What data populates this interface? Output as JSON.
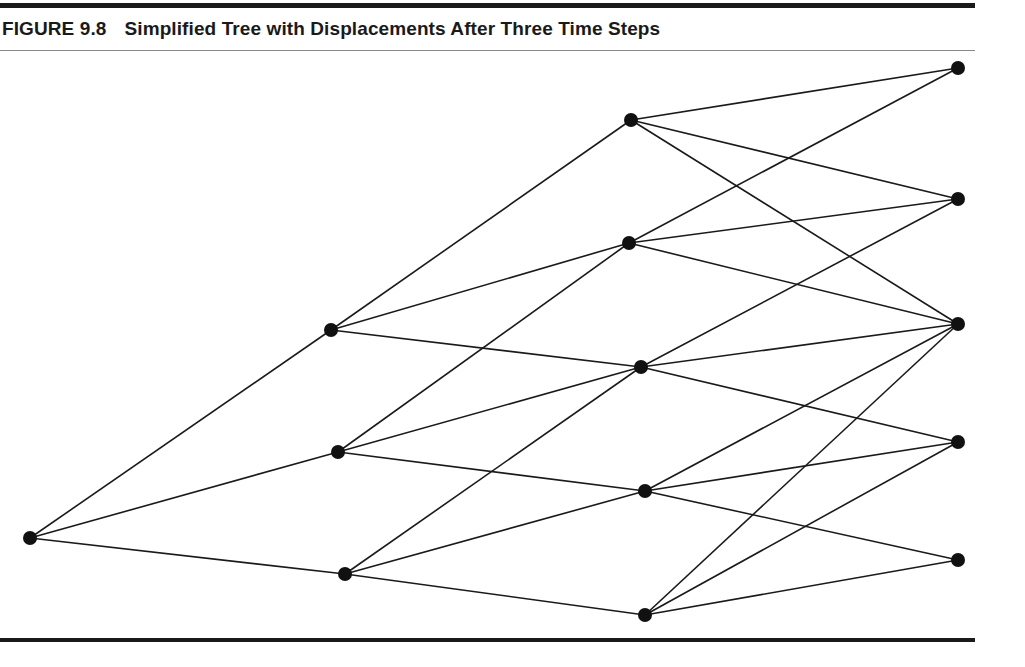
{
  "figure": {
    "label": "FIGURE 9.8",
    "title": "Simplified Tree with Displacements After Three Time Steps"
  },
  "tree": {
    "nodes": [
      {
        "id": "r",
        "step": 0,
        "x": 30,
        "y": 538
      },
      {
        "id": "a1",
        "step": 1,
        "x": 331,
        "y": 330
      },
      {
        "id": "a2",
        "step": 1,
        "x": 338,
        "y": 452
      },
      {
        "id": "a3",
        "step": 1,
        "x": 345,
        "y": 574
      },
      {
        "id": "b1",
        "step": 2,
        "x": 631,
        "y": 120
      },
      {
        "id": "b2",
        "step": 2,
        "x": 629,
        "y": 243
      },
      {
        "id": "b3",
        "step": 2,
        "x": 641,
        "y": 367
      },
      {
        "id": "b4",
        "step": 2,
        "x": 645,
        "y": 491
      },
      {
        "id": "b5",
        "step": 2,
        "x": 645,
        "y": 615
      },
      {
        "id": "c1",
        "step": 3,
        "x": 958,
        "y": 68
      },
      {
        "id": "c2",
        "step": 3,
        "x": 958,
        "y": 199
      },
      {
        "id": "c3",
        "step": 3,
        "x": 958,
        "y": 324
      },
      {
        "id": "c4",
        "step": 3,
        "x": 958,
        "y": 442
      },
      {
        "id": "c5",
        "step": 3,
        "x": 958,
        "y": 560
      }
    ],
    "edges": [
      [
        "r",
        "a1"
      ],
      [
        "r",
        "a2"
      ],
      [
        "r",
        "a3"
      ],
      [
        "a1",
        "b1"
      ],
      [
        "a1",
        "b2"
      ],
      [
        "a1",
        "b3"
      ],
      [
        "a2",
        "b2"
      ],
      [
        "a2",
        "b3"
      ],
      [
        "a2",
        "b4"
      ],
      [
        "a3",
        "b3"
      ],
      [
        "a3",
        "b4"
      ],
      [
        "a3",
        "b5"
      ],
      [
        "b1",
        "c1"
      ],
      [
        "b1",
        "c2"
      ],
      [
        "b1",
        "c3"
      ],
      [
        "b2",
        "c1"
      ],
      [
        "b2",
        "c2"
      ],
      [
        "b2",
        "c3"
      ],
      [
        "b3",
        "c2"
      ],
      [
        "b3",
        "c3"
      ],
      [
        "b3",
        "c4"
      ],
      [
        "b4",
        "c3"
      ],
      [
        "b4",
        "c4"
      ],
      [
        "b4",
        "c5"
      ],
      [
        "b5",
        "c3"
      ],
      [
        "b5",
        "c4"
      ],
      [
        "b5",
        "c5"
      ]
    ],
    "node_radius": 7,
    "line_color": "#1a1a1a",
    "node_color": "#111111"
  }
}
